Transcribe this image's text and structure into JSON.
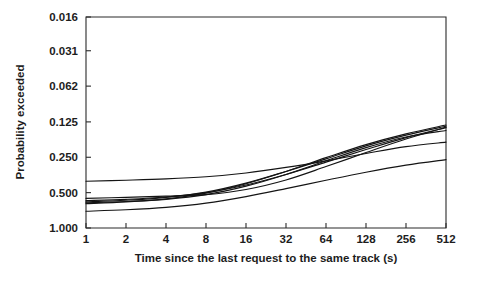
{
  "chart_data": {
    "type": "line",
    "title": "",
    "xlabel": "Time since the last request to the same track (s)",
    "ylabel": "Probability exceeded",
    "xscale": "log2",
    "yscale": "log2-reversed",
    "grid": false,
    "legend": null,
    "x_tick_labels": [
      "1",
      "2",
      "4",
      "8",
      "16",
      "32",
      "64",
      "128",
      "256",
      "512"
    ],
    "x_tick_values": [
      1,
      2,
      4,
      8,
      16,
      32,
      64,
      128,
      256,
      512
    ],
    "y_tick_labels": [
      "0.016",
      "0.031",
      "0.062",
      "0.125",
      "0.250",
      "0.500",
      "1.000"
    ],
    "y_tick_values": [
      0.016,
      0.031,
      0.062,
      0.125,
      0.25,
      0.5,
      1.0
    ],
    "xlim": [
      1,
      512
    ],
    "ylim": [
      1.0,
      0.016
    ],
    "x": [
      1,
      2,
      4,
      8,
      16,
      32,
      64,
      128,
      256,
      512
    ],
    "series": [
      {
        "name": "trace-1",
        "values": [
          0.56,
          0.548,
          0.536,
          0.52,
          0.47,
          0.39,
          0.3,
          0.228,
          0.175,
          0.139
        ]
      },
      {
        "name": "trace-2",
        "values": [
          0.585,
          0.57,
          0.545,
          0.5,
          0.43,
          0.35,
          0.275,
          0.215,
          0.17,
          0.14
        ]
      },
      {
        "name": "trace-3",
        "values": [
          0.6,
          0.58,
          0.548,
          0.495,
          0.415,
          0.33,
          0.258,
          0.2,
          0.162,
          0.136
        ]
      },
      {
        "name": "trace-4",
        "values": [
          0.62,
          0.6,
          0.565,
          0.505,
          0.42,
          0.33,
          0.252,
          0.195,
          0.158,
          0.133
        ]
      },
      {
        "name": "trace-5",
        "values": [
          0.61,
          0.595,
          0.57,
          0.52,
          0.44,
          0.35,
          0.268,
          0.207,
          0.168,
          0.148
        ]
      },
      {
        "name": "trace-6",
        "values": [
          0.4,
          0.392,
          0.382,
          0.366,
          0.34,
          0.305,
          0.268,
          0.232,
          0.203,
          0.186
        ]
      },
      {
        "name": "trace-7",
        "values": [
          0.72,
          0.7,
          0.668,
          0.615,
          0.54,
          0.462,
          0.392,
          0.335,
          0.292,
          0.262
        ]
      }
    ]
  },
  "axes": {
    "x_label": "Time since the last request to the same track (s)",
    "y_label": "Probability exceeded"
  }
}
